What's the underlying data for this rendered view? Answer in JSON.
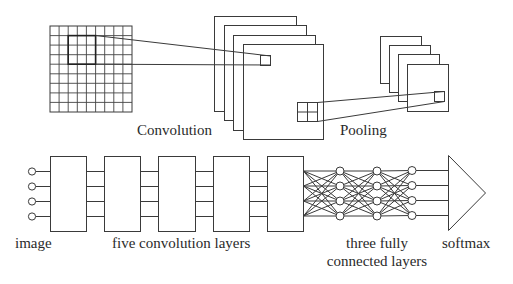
{
  "diagram": {
    "type": "CNN architecture schematic",
    "top_row": {
      "convolution_label": "Convolution",
      "pooling_label": "Pooling",
      "input_grid": {
        "rows": 9,
        "cols": 9,
        "highlighted_kernel": "3x3"
      },
      "convolution_feature_maps": 4,
      "pooling_feature_maps": 4,
      "pooling_window": "2x2"
    },
    "bottom_row": {
      "image_label": "image",
      "conv_layers_label": "five convolution layers",
      "fc_label_line1": "three fully",
      "fc_label_line2": "connected layers",
      "softmax_label": "softmax",
      "input_nodes": 4,
      "conv_blocks": 5,
      "fc_layers": 3,
      "nodes_per_fc_layer": 4
    }
  }
}
